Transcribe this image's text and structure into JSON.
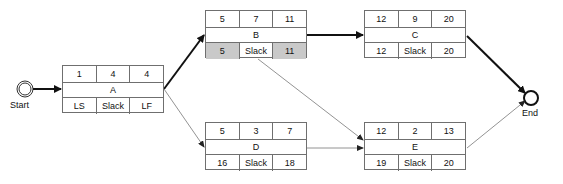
{
  "diagram": {
    "type": "activity-on-node network (critical path)",
    "start_label": "Start",
    "end_label": "End",
    "colors": {
      "line": "#111111",
      "thin_line": "#777777",
      "border": "#6f6f6f",
      "shaded": "#c9c9c9"
    },
    "nodes": {
      "A": {
        "top": [
          "1",
          "4",
          "4"
        ],
        "name": "A",
        "bottom": [
          "LS",
          "Slack",
          "LF"
        ],
        "shaded": [
          false,
          false,
          false
        ]
      },
      "B": {
        "top": [
          "5",
          "7",
          "11"
        ],
        "name": "B",
        "bottom": [
          "5",
          "Slack",
          "11"
        ],
        "shaded": [
          true,
          false,
          true
        ]
      },
      "C": {
        "top": [
          "12",
          "9",
          "20"
        ],
        "name": "C",
        "bottom": [
          "12",
          "Slack",
          "20"
        ],
        "shaded": [
          false,
          false,
          false
        ]
      },
      "D": {
        "top": [
          "5",
          "3",
          "7"
        ],
        "name": "D",
        "bottom": [
          "16",
          "Slack",
          "18"
        ],
        "shaded": [
          false,
          false,
          false
        ]
      },
      "E": {
        "top": [
          "12",
          "2",
          "13"
        ],
        "name": "E",
        "bottom": [
          "19",
          "Slack",
          "20"
        ],
        "shaded": [
          false,
          false,
          false
        ]
      }
    },
    "edges": [
      {
        "from": "Start",
        "to": "A",
        "critical": true
      },
      {
        "from": "A",
        "to": "B",
        "critical": true
      },
      {
        "from": "A",
        "to": "D",
        "critical": false
      },
      {
        "from": "B",
        "to": "C",
        "critical": true
      },
      {
        "from": "B",
        "to": "E",
        "critical": false
      },
      {
        "from": "D",
        "to": "E",
        "critical": false
      },
      {
        "from": "C",
        "to": "End",
        "critical": true
      },
      {
        "from": "E",
        "to": "End",
        "critical": false
      }
    ]
  }
}
